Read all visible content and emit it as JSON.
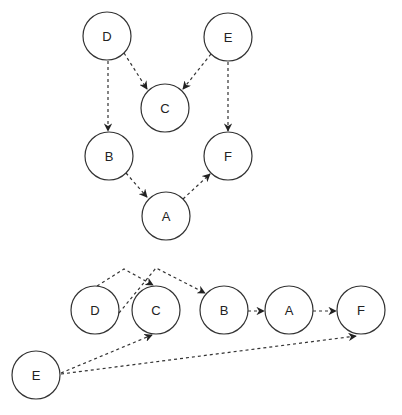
{
  "diagram": {
    "type": "directed-graph",
    "style": {
      "stroke_color": "#333333",
      "fill_color": "#ffffff",
      "edge_style": "dashed",
      "node_radius": 24
    },
    "graphs": [
      {
        "name": "dag-layered",
        "nodes": [
          {
            "id": "D",
            "label": "D",
            "x": 107,
            "y": 36
          },
          {
            "id": "E",
            "label": "E",
            "x": 228,
            "y": 37
          },
          {
            "id": "C",
            "label": "C",
            "x": 165,
            "y": 108
          },
          {
            "id": "B",
            "label": "B",
            "x": 109,
            "y": 156
          },
          {
            "id": "F",
            "label": "F",
            "x": 228,
            "y": 156
          },
          {
            "id": "A",
            "label": "A",
            "x": 166,
            "y": 216
          }
        ],
        "edges": [
          {
            "from": "D",
            "to": "C"
          },
          {
            "from": "E",
            "to": "C"
          },
          {
            "from": "D",
            "to": "B"
          },
          {
            "from": "E",
            "to": "F"
          },
          {
            "from": "B",
            "to": "A"
          },
          {
            "from": "A",
            "to": "F"
          }
        ]
      },
      {
        "name": "topological-order",
        "nodes": [
          {
            "id": "D",
            "label": "D",
            "x": 95,
            "y": 310
          },
          {
            "id": "C",
            "label": "C",
            "x": 156,
            "y": 310
          },
          {
            "id": "B",
            "label": "B",
            "x": 224,
            "y": 310
          },
          {
            "id": "A",
            "label": "A",
            "x": 289,
            "y": 310
          },
          {
            "id": "F",
            "label": "F",
            "x": 361,
            "y": 310
          },
          {
            "id": "E",
            "label": "E",
            "x": 36,
            "y": 375
          }
        ],
        "edges": [
          {
            "from": "D",
            "to": "C"
          },
          {
            "from": "D",
            "to": "B"
          },
          {
            "from": "B",
            "to": "A"
          },
          {
            "from": "A",
            "to": "F"
          },
          {
            "from": "E",
            "to": "C"
          },
          {
            "from": "E",
            "to": "F"
          }
        ]
      }
    ]
  }
}
